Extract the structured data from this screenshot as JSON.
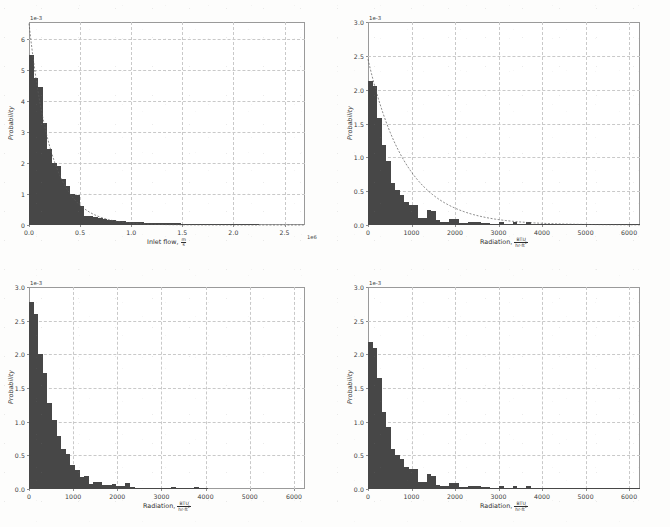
{
  "figure": {
    "kind": "four-panel-histogram-figure",
    "panels": 4,
    "bar_color": "#474747",
    "grid_color": "#c9c9c9",
    "frame_color": "#9a9a9a"
  },
  "units": {
    "velocity_num": "m",
    "velocity_den": "s",
    "radiation_num": "BTU",
    "radiation_den_a": "hr",
    "radiation_den_b": "ft",
    "radiation_den_exp": "2"
  },
  "chart_data": [
    {
      "id": "inlet-flow-histogram",
      "type": "bar",
      "title": "",
      "xlabel": "Inlet flow,",
      "xlabel_unit": "m/s",
      "ylabel": "Probability",
      "y_offset_text": "1e-3",
      "x_offset_text": "1e6",
      "xlim": [
        0,
        2.7
      ],
      "ylim": [
        0,
        6.55
      ],
      "xticks": [
        0.0,
        0.5,
        1.0,
        1.5,
        2.0,
        2.5
      ],
      "xticklabels": [
        "0.0",
        "0.5",
        "1.0",
        "1.5",
        "2.0",
        "2.5"
      ],
      "yticks": [
        0,
        1,
        2,
        3,
        4,
        5,
        6
      ],
      "yticklabels": [
        "0",
        "1",
        "2",
        "3",
        "4",
        "5",
        "6"
      ],
      "grid": true,
      "bin_width": 0.045,
      "bin_starts": [
        0.0,
        0.045,
        0.09,
        0.135,
        0.18,
        0.225,
        0.27,
        0.315,
        0.36,
        0.405,
        0.45,
        0.495,
        0.54,
        0.585,
        0.63,
        0.675,
        0.72,
        0.765,
        0.81,
        0.855,
        0.9,
        0.945,
        0.99,
        1.035,
        1.08,
        1.125,
        1.17,
        1.215,
        1.26,
        1.305,
        1.35,
        1.395,
        1.44,
        1.485,
        1.53,
        1.575,
        1.62,
        1.665,
        1.71,
        1.755,
        1.8,
        1.845,
        1.89,
        1.935,
        1.98,
        2.025,
        2.07,
        2.115,
        2.16,
        2.205,
        2.25,
        2.295,
        2.34,
        2.385,
        2.43,
        2.475,
        2.52,
        2.565,
        2.61,
        2.655
      ],
      "values": [
        5.5,
        4.75,
        4.45,
        3.3,
        2.45,
        2.0,
        1.9,
        1.5,
        1.25,
        1.0,
        0.98,
        0.62,
        0.3,
        0.28,
        0.27,
        0.22,
        0.2,
        0.17,
        0.15,
        0.13,
        0.12,
        0.1,
        0.1,
        0.1,
        0.09,
        0.08,
        0.08,
        0.07,
        0.07,
        0.06,
        0.06,
        0.05,
        0.05,
        0.04,
        0.04,
        0.03,
        0.03,
        0.03,
        0.02,
        0.02,
        0.02,
        0.02,
        0.02,
        0.01,
        0.01,
        0.01,
        0.01,
        0.01,
        0.01,
        0.01,
        0.0,
        0.0,
        0.0,
        0.0,
        0.0,
        0.0,
        0.0,
        0.0,
        0.0,
        0.0
      ],
      "fit_curve": {
        "present": true,
        "style": "dashed",
        "peak_value": 6.5
      }
    },
    {
      "id": "radiation-histogram-top-right",
      "type": "bar",
      "title": "",
      "xlabel": "Radiation,",
      "xlabel_unit": "BTU/(hr ft^2)",
      "ylabel": "Probability",
      "y_offset_text": "1e-3",
      "xlim": [
        0,
        6250
      ],
      "ylim": [
        0,
        3.0
      ],
      "xticks": [
        0,
        1000,
        2000,
        3000,
        4000,
        5000,
        6000
      ],
      "xticklabels": [
        "0",
        "1000",
        "2000",
        "3000",
        "4000",
        "5000",
        "6000"
      ],
      "yticks": [
        0.0,
        0.5,
        1.0,
        1.5,
        2.0,
        2.5,
        3.0
      ],
      "yticklabels": [
        "0.0",
        "0.5",
        "1.0",
        "1.5",
        "2.0",
        "2.5",
        "3.0"
      ],
      "grid": true,
      "bin_width": 104,
      "bin_starts": [
        0,
        104,
        208,
        312,
        416,
        520,
        624,
        728,
        832,
        936,
        1040,
        1144,
        1248,
        1352,
        1456,
        1560,
        1664,
        1768,
        1872,
        1976,
        2080,
        2184,
        2288,
        2392,
        2496,
        2600,
        2704,
        2808,
        2912,
        3016,
        3120,
        3224,
        3328,
        3432,
        3536,
        3640,
        3744,
        3848,
        3952,
        4056,
        4160,
        4264,
        4368,
        4472,
        4576,
        4680,
        4784,
        4888,
        4992,
        5096,
        5200,
        5304,
        5408,
        5512,
        5616,
        5720,
        5824,
        5928,
        6032,
        6136
      ],
      "values": [
        2.13,
        2.05,
        1.58,
        1.18,
        0.95,
        0.62,
        0.52,
        0.45,
        0.34,
        0.3,
        0.29,
        0.11,
        0.1,
        0.22,
        0.2,
        0.07,
        0.05,
        0.05,
        0.09,
        0.09,
        0.03,
        0.03,
        0.04,
        0.04,
        0.05,
        0.03,
        0.03,
        0.02,
        0.02,
        0.04,
        0.02,
        0.02,
        0.05,
        0.02,
        0.02,
        0.05,
        0.02,
        0.02,
        0.02,
        0.02,
        0.01,
        0.01,
        0.01,
        0.01,
        0.01,
        0.01,
        0.01,
        0.01,
        0.02,
        0.01,
        0.01,
        0.01,
        0.01,
        0.01,
        0.01,
        0.01,
        0.01,
        0.01,
        0.02,
        0.02
      ],
      "fit_curve": {
        "present": true,
        "style": "dashed",
        "peak_value": 2.45
      }
    },
    {
      "id": "radiation-histogram-bottom-left",
      "type": "bar",
      "title": "",
      "xlabel": "Radiation,",
      "xlabel_unit": "BTU/(hr ft^2)",
      "ylabel": "Probability",
      "y_offset_text": "1e-3",
      "xlim": [
        0,
        6250
      ],
      "ylim": [
        0,
        3.0
      ],
      "xticks": [
        0,
        1000,
        2000,
        3000,
        4000,
        5000,
        6000
      ],
      "xticklabels": [
        "0",
        "1000",
        "2000",
        "3000",
        "4000",
        "5000",
        "6000"
      ],
      "yticks": [
        0.0,
        0.5,
        1.0,
        1.5,
        2.0,
        2.5,
        3.0
      ],
      "yticklabels": [
        "0.0",
        "0.5",
        "1.0",
        "1.5",
        "2.0",
        "2.5",
        "3.0"
      ],
      "grid": true,
      "bin_width": 104,
      "bin_starts": [
        0,
        104,
        208,
        312,
        416,
        520,
        624,
        728,
        832,
        936,
        1040,
        1144,
        1248,
        1352,
        1456,
        1560,
        1664,
        1768,
        1872,
        1976,
        2080,
        2184,
        2288,
        2392,
        2496,
        2600,
        2704,
        2808,
        2912,
        3016,
        3120,
        3224,
        3328,
        3432,
        3536,
        3640,
        3744,
        3848,
        3952,
        4056,
        4160,
        4264,
        4368,
        4472,
        4576,
        4680,
        4784,
        4888,
        4992,
        5096,
        5200,
        5304,
        5408,
        5512,
        5616,
        5720,
        5824,
        5928,
        6032,
        6136
      ],
      "values": [
        2.78,
        2.6,
        2.0,
        1.72,
        1.28,
        1.02,
        0.78,
        0.6,
        0.52,
        0.35,
        0.28,
        0.18,
        0.2,
        0.08,
        0.1,
        0.11,
        0.06,
        0.06,
        0.07,
        0.05,
        0.04,
        0.09,
        0.03,
        0.02,
        0.02,
        0.02,
        0.01,
        0.02,
        0.02,
        0.02,
        0.01,
        0.03,
        0.02,
        0.01,
        0.02,
        0.02,
        0.03,
        0.02,
        0.01,
        0.0,
        0.0,
        0.0,
        0.0,
        0.0,
        0.0,
        0.0,
        0.0,
        0.0,
        0.0,
        0.0,
        0.0,
        0.0,
        0.0,
        0.0,
        0.0,
        0.0,
        0.0,
        0.0,
        0.0,
        0.0
      ],
      "fit_curve": {
        "present": false,
        "style": "dashed",
        "peak_value": 0
      }
    },
    {
      "id": "radiation-histogram-bottom-right",
      "type": "bar",
      "title": "",
      "xlabel": "Radiation,",
      "xlabel_unit": "BTU/(hr ft^2)",
      "ylabel": "Probability",
      "y_offset_text": "1e-3",
      "xlim": [
        0,
        6250
      ],
      "ylim": [
        0,
        3.0
      ],
      "xticks": [
        0,
        1000,
        2000,
        3000,
        4000,
        5000,
        6000
      ],
      "xticklabels": [
        "0",
        "1000",
        "2000",
        "3000",
        "4000",
        "5000",
        "6000"
      ],
      "yticks": [
        0.0,
        0.5,
        1.0,
        1.5,
        2.0,
        2.5,
        3.0
      ],
      "yticklabels": [
        "0.0",
        "0.5",
        "1.0",
        "1.5",
        "2.0",
        "2.5",
        "3.0"
      ],
      "grid": true,
      "bin_width": 104,
      "bin_starts": [
        0,
        104,
        208,
        312,
        416,
        520,
        624,
        728,
        832,
        936,
        1040,
        1144,
        1248,
        1352,
        1456,
        1560,
        1664,
        1768,
        1872,
        1976,
        2080,
        2184,
        2288,
        2392,
        2496,
        2600,
        2704,
        2808,
        2912,
        3016,
        3120,
        3224,
        3328,
        3432,
        3536,
        3640,
        3744,
        3848,
        3952,
        4056,
        4160,
        4264,
        4368,
        4472,
        4576,
        4680,
        4784,
        4888,
        4992,
        5096,
        5200,
        5304,
        5408,
        5512,
        5616,
        5720,
        5824,
        5928,
        6032,
        6136
      ],
      "values": [
        2.18,
        2.1,
        1.65,
        1.15,
        0.92,
        0.6,
        0.5,
        0.44,
        0.33,
        0.3,
        0.29,
        0.11,
        0.1,
        0.22,
        0.2,
        0.06,
        0.05,
        0.05,
        0.09,
        0.09,
        0.03,
        0.03,
        0.04,
        0.04,
        0.05,
        0.03,
        0.03,
        0.02,
        0.02,
        0.05,
        0.02,
        0.02,
        0.05,
        0.02,
        0.02,
        0.05,
        0.02,
        0.02,
        0.02,
        0.02,
        0.01,
        0.01,
        0.01,
        0.01,
        0.01,
        0.01,
        0.01,
        0.01,
        0.02,
        0.01,
        0.01,
        0.01,
        0.01,
        0.01,
        0.01,
        0.01,
        0.01,
        0.01,
        0.02,
        0.02
      ],
      "fit_curve": {
        "present": false,
        "style": "dashed",
        "peak_value": 0
      }
    }
  ]
}
